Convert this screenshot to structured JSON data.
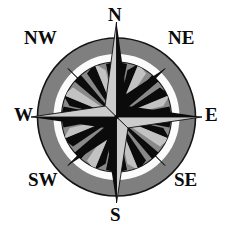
{
  "figure": {
    "type": "compass-rose",
    "canvas": {
      "width": 233,
      "height": 233,
      "background": "#ffffff"
    },
    "geometry": {
      "center_x": 116.5,
      "center_y": 117,
      "outer_disk_radius": 79,
      "white_ring_outer_radius": 62,
      "white_ring_inner_radius": 55,
      "inner_disk_radius": 55,
      "major_point_length": 96,
      "minor_point_length": 57,
      "micro_point_length": 54
    },
    "colors": {
      "background": "#ffffff",
      "outer_disk_gray": "#807f7f",
      "inner_disk_gray": "#8a8989",
      "ring_white": "#fbfbfb",
      "point_dark": "#0b0b0b",
      "point_light": "#b9b8b8",
      "point_mid_gray": "#6e6d6d",
      "outline": "#141414",
      "label_text": "#0b0b0b"
    }
  },
  "labels": {
    "n": {
      "text": "N",
      "name": "north"
    },
    "ne": {
      "text": "NE",
      "name": "northeast"
    },
    "e": {
      "text": "E",
      "name": "east"
    },
    "se": {
      "text": "SE",
      "name": "southeast"
    },
    "s": {
      "text": "S",
      "name": "south"
    },
    "sw": {
      "text": "SW",
      "name": "southwest"
    },
    "w": {
      "text": "W",
      "name": "west"
    },
    "nw": {
      "text": "NW",
      "name": "northwest"
    }
  }
}
